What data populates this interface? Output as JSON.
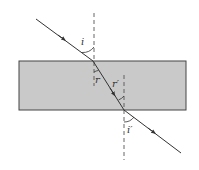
{
  "diagram": {
    "colors": {
      "slab_fill": "#c9c9c9",
      "slab_border": "#444444",
      "ray": "#333333",
      "normal": "#555555",
      "background": "#ffffff"
    },
    "slab": {
      "x": 19,
      "y": 61,
      "width": 167,
      "height": 49
    },
    "normals": [
      {
        "id": "normal-top",
        "x": 94,
        "y1": 13,
        "y2": 86
      },
      {
        "id": "normal-bottom",
        "x": 124,
        "y1": 75,
        "y2": 160
      }
    ],
    "rays": [
      {
        "id": "incident-ray",
        "x1": 36,
        "y1": 19,
        "x2": 93,
        "y2": 61
      },
      {
        "id": "refracted-ray",
        "x1": 93,
        "y1": 61,
        "x2": 124,
        "y2": 110
      },
      {
        "id": "emergent-ray",
        "x1": 124,
        "y1": 110,
        "x2": 181,
        "y2": 153
      }
    ],
    "labels": {
      "incidence_angle": "i",
      "refraction_angle": "r",
      "internal_incidence_angle": "r′",
      "emergence_angle": "i′"
    }
  }
}
